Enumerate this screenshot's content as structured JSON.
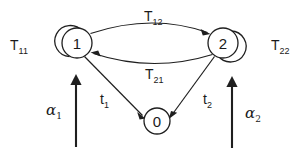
{
  "diagram": {
    "type": "state-transition-diagram",
    "title": "",
    "background_color": "#ffffff",
    "stroke_color": "#1f1f1f",
    "nodes": [
      {
        "id": "1",
        "label": "1",
        "cx": 77,
        "cy": 43,
        "r": 15
      },
      {
        "id": "2",
        "label": "2",
        "cx": 223,
        "cy": 43,
        "r": 15
      },
      {
        "id": "0",
        "label": "0",
        "cx": 157,
        "cy": 121,
        "r": 13
      }
    ],
    "edges": [
      {
        "id": "T11",
        "base": "T",
        "sub": "11",
        "from": "1",
        "to": "1",
        "kind": "self-loop",
        "side": "left",
        "label_x": 10,
        "label_y": 49
      },
      {
        "id": "T22",
        "base": "T",
        "sub": "22",
        "from": "2",
        "to": "2",
        "kind": "self-loop",
        "side": "right",
        "label_x": 271,
        "label_y": 49
      },
      {
        "id": "T12",
        "base": "T",
        "sub": "12",
        "from": "1",
        "to": "2",
        "kind": "arc-top",
        "label_x": 143,
        "label_y": 21
      },
      {
        "id": "T21",
        "base": "T",
        "sub": "21",
        "from": "2",
        "to": "1",
        "kind": "arc-bottom",
        "label_x": 144,
        "label_y": 78
      },
      {
        "id": "t1",
        "base": "t",
        "sub": "1",
        "from": "1",
        "to": "0",
        "kind": "straight",
        "label_x": 99,
        "label_y": 104
      },
      {
        "id": "t2",
        "base": "t",
        "sub": "2",
        "from": "2",
        "to": "0",
        "kind": "straight",
        "label_x": 202,
        "label_y": 104
      },
      {
        "id": "alpha1",
        "base": "α",
        "sub": "1",
        "from": "external",
        "to": "1",
        "kind": "vertical-arrow",
        "label_x": 46,
        "label_y": 116
      },
      {
        "id": "alpha2",
        "base": "α",
        "sub": "2",
        "from": "external",
        "to": "2",
        "kind": "vertical-arrow",
        "label_x": 244,
        "label_y": 119
      }
    ],
    "labels": {
      "node_1": "1",
      "node_2": "2",
      "node_0": "0",
      "T11_base": "T",
      "T11_sub": "11",
      "T22_base": "T",
      "T22_sub": "22",
      "T12_base": "T",
      "T12_sub": "12",
      "T21_base": "T",
      "T21_sub": "21",
      "t1_base": "t",
      "t1_sub": "1",
      "t2_base": "t",
      "t2_sub": "2",
      "alpha1_base": "α",
      "alpha1_sub": "1",
      "alpha2_base": "α",
      "alpha2_sub": "2"
    }
  }
}
